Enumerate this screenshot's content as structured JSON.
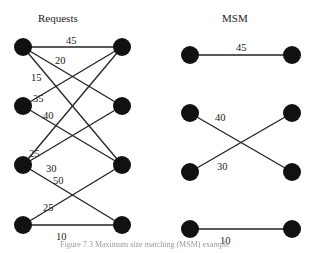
{
  "left_graph": {
    "title": "Requests",
    "left_nodes": [
      {
        "x": 23,
        "y": 47
      },
      {
        "x": 23,
        "y": 106
      },
      {
        "x": 23,
        "y": 165
      },
      {
        "x": 23,
        "y": 225
      }
    ],
    "right_nodes": [
      {
        "x": 122,
        "y": 47
      },
      {
        "x": 122,
        "y": 106
      },
      {
        "x": 122,
        "y": 165
      },
      {
        "x": 122,
        "y": 225
      }
    ],
    "edges": [
      {
        "from": 0,
        "to": 0,
        "weight": "45",
        "lx": 66,
        "ly": 44
      },
      {
        "from": 0,
        "to": 1,
        "weight": "20",
        "lx": 55,
        "ly": 64
      },
      {
        "from": 0,
        "to": 2,
        "weight": "15",
        "lx": 31,
        "ly": 81
      },
      {
        "from": 1,
        "to": 0,
        "weight": "35",
        "lx": 33,
        "ly": 102
      },
      {
        "from": 1,
        "to": 2,
        "weight": "40",
        "lx": 43,
        "ly": 119
      },
      {
        "from": 2,
        "to": 0,
        "weight": "25",
        "lx": 29,
        "ly": 157
      },
      {
        "from": 2,
        "to": 1,
        "weight": "30",
        "lx": 46,
        "ly": 172
      },
      {
        "from": 2,
        "to": 3,
        "weight": "50",
        "lx": 53,
        "ly": 184
      },
      {
        "from": 3,
        "to": 2,
        "weight": "25",
        "lx": 43,
        "ly": 211
      },
      {
        "from": 3,
        "to": 3,
        "weight": "10",
        "lx": 56,
        "ly": 240
      }
    ]
  },
  "right_graph": {
    "title": "MSM",
    "left_nodes": [
      {
        "x": 190,
        "y": 55
      },
      {
        "x": 190,
        "y": 113
      },
      {
        "x": 190,
        "y": 172
      },
      {
        "x": 190,
        "y": 229
      }
    ],
    "right_nodes": [
      {
        "x": 292,
        "y": 55
      },
      {
        "x": 292,
        "y": 113
      },
      {
        "x": 292,
        "y": 172
      },
      {
        "x": 292,
        "y": 229
      }
    ],
    "edges": [
      {
        "from": 0,
        "to": 0,
        "weight": "45",
        "lx": 236,
        "ly": 51
      },
      {
        "from": 1,
        "to": 2,
        "weight": "40",
        "lx": 215,
        "ly": 121
      },
      {
        "from": 2,
        "to": 1,
        "weight": "30",
        "lx": 217,
        "ly": 170
      },
      {
        "from": 3,
        "to": 3,
        "weight": "10",
        "lx": 220,
        "ly": 244
      }
    ]
  },
  "caption": "Figure 7.3  Maximum size matching (MSM) example"
}
